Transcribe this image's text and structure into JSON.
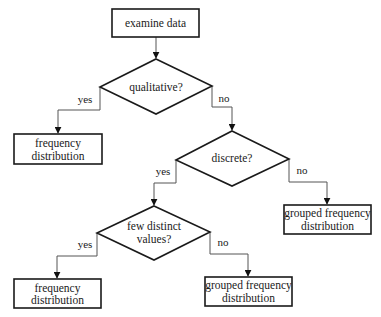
{
  "diagram": {
    "type": "flowchart",
    "colors": {
      "stroke": "#1a1a1a",
      "connector": "#555555",
      "background": "#ffffff"
    },
    "nodes": {
      "examine": {
        "kind": "process",
        "lines": [
          "examine data"
        ]
      },
      "qualitative": {
        "kind": "decision",
        "lines": [
          "qualitative?"
        ]
      },
      "freq1": {
        "kind": "process",
        "lines": [
          "frequency",
          "distribution"
        ]
      },
      "discrete": {
        "kind": "decision",
        "lines": [
          "discrete?"
        ]
      },
      "grouped1": {
        "kind": "process",
        "lines": [
          "grouped frequency",
          "distribution"
        ]
      },
      "few_distinct": {
        "kind": "decision",
        "lines": [
          "few distinct",
          "values?"
        ]
      },
      "freq2": {
        "kind": "process",
        "lines": [
          "frequency",
          "distribution"
        ]
      },
      "grouped2": {
        "kind": "process",
        "lines": [
          "grouped frequency",
          "distribution"
        ]
      }
    },
    "edges": [
      {
        "from": "examine",
        "to": "qualitative",
        "label": ""
      },
      {
        "from": "qualitative",
        "to": "freq1",
        "label": "yes"
      },
      {
        "from": "qualitative",
        "to": "discrete",
        "label": "no"
      },
      {
        "from": "discrete",
        "to": "few_distinct",
        "label": "yes"
      },
      {
        "from": "discrete",
        "to": "grouped1",
        "label": "no"
      },
      {
        "from": "few_distinct",
        "to": "freq2",
        "label": "yes"
      },
      {
        "from": "few_distinct",
        "to": "grouped2",
        "label": "no"
      }
    ]
  }
}
